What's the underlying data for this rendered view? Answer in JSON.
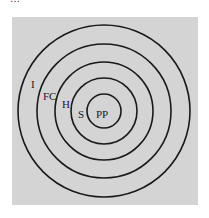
{
  "caption_fragment": "…",
  "diagram": {
    "type": "concentric-circles",
    "background": "#d4d4d4",
    "stroke": "#1a1a1a",
    "center": [
      104,
      111
    ],
    "rings": [
      {
        "label": "I",
        "radius": 86
      },
      {
        "label": "FC",
        "radius": 67
      },
      {
        "label": "H",
        "radius": 49
      },
      {
        "label": "S",
        "radius": 33
      },
      {
        "label": "PP",
        "radius": 17
      }
    ]
  }
}
